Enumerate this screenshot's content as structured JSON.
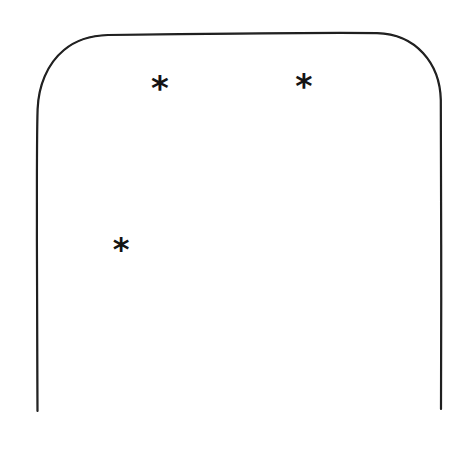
{
  "figure": {
    "canvas": {
      "width": 459,
      "height": 456,
      "background_color": "#ffffff"
    },
    "outline": {
      "name": "arch-outline",
      "description": "Hand-drawn rounded-top rectangle with open bottom (two vertical lines ending free)",
      "stroke_color": "#1a1a1a",
      "stroke_width": 2.2,
      "fill": "none",
      "left_x": 37,
      "right_x": 441,
      "top_y": 33,
      "bottom_y": 411,
      "corner_radius": 66,
      "closed_bottom": false,
      "path": "M 37 411 L 37 106 C 37 70, 62 39, 103 35 L 376 33 C 414 34, 441 64, 441 100 L 441 409"
    },
    "marks": [
      {
        "id": "asterisk-1",
        "glyph": "*",
        "label": "asterisk",
        "x": 160,
        "y": 88,
        "size": 34,
        "color": "#141414"
      },
      {
        "id": "asterisk-2",
        "glyph": "*",
        "label": "asterisk",
        "x": 304,
        "y": 86,
        "size": 33,
        "color": "#141414"
      },
      {
        "id": "asterisk-3",
        "glyph": "*",
        "label": "asterisk",
        "x": 121,
        "y": 249,
        "size": 32,
        "color": "#141414"
      }
    ],
    "mark_count": 3
  }
}
